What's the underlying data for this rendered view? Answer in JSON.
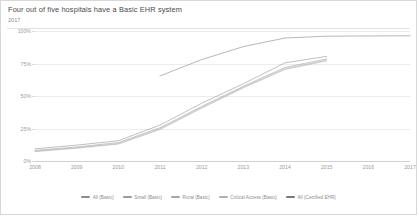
{
  "header": {
    "title": "Four out of five hospitals have a Basic EHR system",
    "subtitle": "2017"
  },
  "chart_data": {
    "type": "line",
    "title": "Four out of five hospitals have a Basic EHR system",
    "subtitle": "2017",
    "xlabel": "",
    "ylabel": "",
    "x": [
      2008,
      2009,
      2010,
      2011,
      2012,
      2013,
      2014,
      2015,
      2016,
      2017
    ],
    "categories": [
      "2008",
      "2009",
      "2010",
      "2011",
      "2012",
      "2013",
      "2014",
      "2015",
      "2016",
      "2017"
    ],
    "ylim": [
      0,
      100
    ],
    "yticks": [
      0,
      25,
      50,
      75,
      100
    ],
    "ytick_labels": [
      "0%",
      "25%",
      "50%",
      "75%",
      "100%"
    ],
    "grid": true,
    "legend_position": "bottom",
    "series": [
      {
        "name": "All (Basic)",
        "color": "#8c8c8c",
        "x": [
          2008,
          2009,
          2010,
          2011,
          2012,
          2013,
          2014,
          2015
        ],
        "values": [
          9.4,
          12.2,
          15.6,
          27.6,
          44.4,
          59.4,
          75.5,
          80.5
        ]
      },
      {
        "name": "Small (Basic)",
        "color": "#9a9a9a",
        "x": [
          2008,
          2009,
          2010,
          2011,
          2012,
          2013,
          2014,
          2015
        ],
        "values": [
          8.2,
          10.8,
          14.2,
          25.6,
          42.0,
          57.5,
          72.0,
          78.5
        ]
      },
      {
        "name": "Rural (Basic)",
        "color": "#a6a6a6",
        "x": [
          2008,
          2009,
          2010,
          2011,
          2012,
          2013,
          2014,
          2015
        ],
        "values": [
          7.6,
          10.2,
          13.4,
          24.8,
          41.2,
          56.8,
          71.0,
          77.6
        ]
      },
      {
        "name": "Critical Access (Basic)",
        "color": "#b0b0b0",
        "x": [
          2008,
          2009,
          2010,
          2011,
          2012,
          2013,
          2014,
          2015
        ],
        "values": [
          7.2,
          9.8,
          13.0,
          24.2,
          40.6,
          56.2,
          70.4,
          77.0
        ]
      },
      {
        "name": "All (Certified EHR)",
        "color": "#7a7a7a",
        "x": [
          2011,
          2012,
          2013,
          2014,
          2015,
          2016,
          2017
        ],
        "values": [
          65.4,
          78.0,
          88.0,
          94.6,
          96.0,
          96.2,
          96.3
        ]
      }
    ]
  },
  "legend": {
    "items": [
      {
        "label": "All (Basic)",
        "color": "#8c8c8c"
      },
      {
        "label": "Small (Basic)",
        "color": "#9a9a9a"
      },
      {
        "label": "Rural (Basic)",
        "color": "#a6a6a6"
      },
      {
        "label": "Critical Access (Basic)",
        "color": "#b0b0b0"
      },
      {
        "label": "All (Certified EHR)",
        "color": "#7a7a7a"
      }
    ]
  }
}
